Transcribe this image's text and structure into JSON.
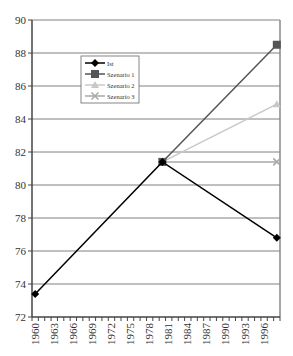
{
  "chart_data": {
    "type": "line",
    "title": "",
    "xlabel": "",
    "ylabel": "",
    "ylim": [
      72,
      90
    ],
    "yticks": [
      72,
      74,
      76,
      78,
      80,
      82,
      84,
      86,
      88,
      90
    ],
    "grid": true,
    "legend_position": "upper-left-inside",
    "x": [
      1960,
      1961,
      1962,
      1963,
      1964,
      1965,
      1966,
      1967,
      1968,
      1969,
      1970,
      1971,
      1972,
      1973,
      1974,
      1975,
      1976,
      1977,
      1978,
      1979,
      1980,
      1981,
      1982,
      1983,
      1984,
      1985,
      1986,
      1987,
      1988,
      1989,
      1990,
      1991,
      1992,
      1993,
      1994,
      1995,
      1996,
      1997,
      1998
    ],
    "xtick_labels": [
      "1960",
      "1963",
      "1966",
      "1969",
      "1972",
      "1975",
      "1978",
      "1981",
      "1984",
      "1987",
      "1990",
      "1993",
      "1996"
    ],
    "series": [
      {
        "name": "Ist",
        "color": "#000000",
        "marker": "diamond",
        "points": [
          [
            1960,
            73.4
          ],
          [
            1980,
            81.4
          ],
          [
            1998,
            76.8
          ]
        ]
      },
      {
        "name": "Szenario 1",
        "color": "#555555",
        "marker": "square",
        "points": [
          [
            1980,
            81.4
          ],
          [
            1998,
            88.5
          ]
        ]
      },
      {
        "name": "Szenario 2",
        "color": "#c8c8c8",
        "marker": "triangle",
        "points": [
          [
            1980,
            81.4
          ],
          [
            1998,
            84.9
          ]
        ]
      },
      {
        "name": "Szenario 3",
        "color": "#a8a8a8",
        "marker": "x",
        "points": [
          [
            1980,
            81.4
          ],
          [
            1998,
            81.4
          ]
        ]
      }
    ]
  },
  "colors": {
    "grid": "#808080",
    "axis": "#444444",
    "frame": "#888888"
  }
}
